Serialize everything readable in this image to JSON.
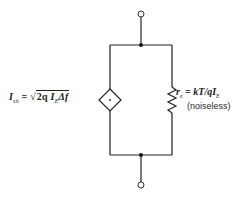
{
  "diagram": {
    "colors": {
      "line": "#222222",
      "background": "#ffffff"
    },
    "current_source": {
      "symbol": "dependent-current-source-diamond",
      "label_var": "I",
      "label_sub": "sh",
      "equals": "=",
      "radical": "√",
      "expr_pre": "2q",
      "expr_var": "I",
      "expr_sub": "E",
      "expr_post": "Δf"
    },
    "resistor": {
      "label_var": "r",
      "label_sub": "e",
      "equals": "=",
      "expr": "kT/qI",
      "expr_sub": "E",
      "note": "(noiseless)"
    },
    "terminals": [
      "top-terminal",
      "bottom-terminal"
    ],
    "nodes": [
      "top-node",
      "bottom-node"
    ]
  }
}
